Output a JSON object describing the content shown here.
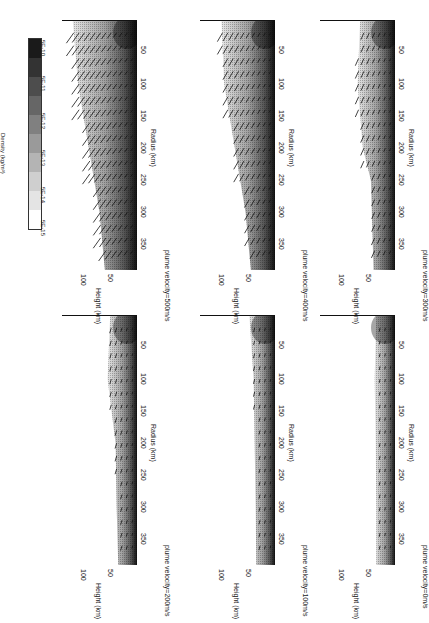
{
  "chart_data": {
    "type": "heatmap",
    "orientation": "figure rotated 90 degrees clockwise on page",
    "colorbar": {
      "title": "Density (kg/m³)",
      "ticks": [
        "5E-15",
        "5E-14",
        "5E-13",
        "5E-12",
        "5E-11",
        "5E-10"
      ],
      "levels": [
        "#ffffff",
        "#e4e4e4",
        "#cfcfcf",
        "#b4b4b4",
        "#9a9a9a",
        "#808080",
        "#666666",
        "#4d4d4d",
        "#333333",
        "#1a1a1a"
      ]
    },
    "xlabel": "Radius (km)",
    "ylabel": "Height (km)",
    "xticks": [
      "50",
      "100",
      "150",
      "200",
      "250",
      "300",
      "350"
    ],
    "yticks": [
      "50",
      "100"
    ],
    "xlim": [
      0,
      390
    ],
    "ylim": [
      0,
      140
    ],
    "panels": [
      {
        "id": "v500",
        "title": "plume velocity=500m/s",
        "plume_height_km": 135,
        "shock_edge_km": [
          [
            0,
            120
          ],
          [
            100,
            110
          ],
          [
            200,
            90
          ],
          [
            300,
            70
          ],
          [
            390,
            60
          ]
        ],
        "arrows": "large outward/upward"
      },
      {
        "id": "v400",
        "title": "plume velocity=400m/s",
        "plume_height_km": 110,
        "shock_edge_km": [
          [
            0,
            100
          ],
          [
            100,
            95
          ],
          [
            200,
            75
          ],
          [
            300,
            55
          ],
          [
            390,
            45
          ]
        ],
        "arrows": "moderate outward/upward"
      },
      {
        "id": "v300",
        "title": "plume velocity=300m/s",
        "plume_height_km": 85,
        "shock_edge_km": [
          [
            0,
            65
          ],
          [
            100,
            70
          ],
          [
            200,
            60
          ],
          [
            250,
            45
          ],
          [
            390,
            40
          ]
        ],
        "arrows": "small outward"
      },
      {
        "id": "v200",
        "title": "plume velocity=200m/s",
        "plume_height_km": 55,
        "shock_edge_km": [
          [
            0,
            50
          ],
          [
            100,
            55
          ],
          [
            200,
            40
          ],
          [
            300,
            38
          ],
          [
            390,
            35
          ]
        ],
        "arrows": "weak"
      },
      {
        "id": "v100",
        "title": "plume velocity=100m/s",
        "plume_height_km": 45,
        "shock_edge_km": [
          [
            0,
            48
          ],
          [
            100,
            40
          ],
          [
            200,
            38
          ],
          [
            300,
            36
          ],
          [
            390,
            35
          ]
        ],
        "arrows": "very weak"
      },
      {
        "id": "v0",
        "title": "plume velocity=0m/s",
        "plume_height_km": 35,
        "shock_edge_km": [
          [
            0,
            35
          ],
          [
            100,
            38
          ],
          [
            200,
            36
          ],
          [
            300,
            35
          ],
          [
            390,
            35
          ]
        ],
        "arrows": "negligible"
      }
    ]
  },
  "colorbar": {
    "title": "Density (kg/m³)",
    "ticks": [
      "5E-15",
      "5E-14",
      "5E-13",
      "5E-12",
      "5E-11",
      "5E-10"
    ]
  },
  "axes": {
    "xlabel": "Radius (km)",
    "ylabel": "Height (km)",
    "xticks": [
      "50",
      "100",
      "150",
      "200",
      "250",
      "300",
      "350"
    ],
    "yticks": [
      "100",
      "50"
    ]
  },
  "panels": [
    {
      "title": "plume velocity=500m/s"
    },
    {
      "title": "plume velocity=400m/s"
    },
    {
      "title": "plume velocity=300m/s"
    },
    {
      "title": "plume velocity=200m/s"
    },
    {
      "title": "plume velocity=100m/s"
    },
    {
      "title": "plume velocity=0m/s"
    }
  ]
}
